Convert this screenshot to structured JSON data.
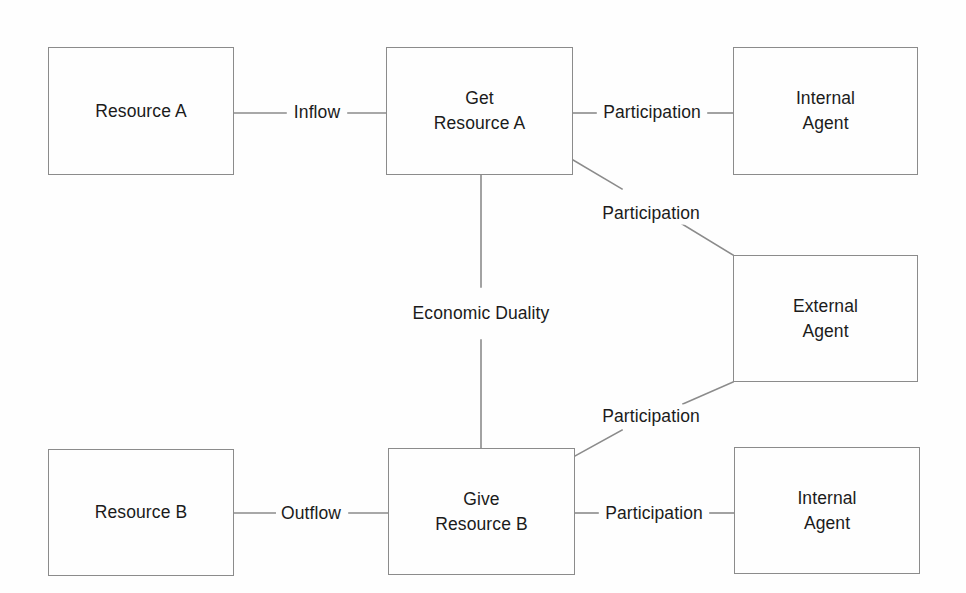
{
  "diagram": {
    "background_color": "#fefefe",
    "line_color": "#8b8b8b",
    "text_color": "#1b1b1b",
    "nodes": [
      {
        "id": "resource-a",
        "label": "Resource A",
        "x": 48,
        "y": 47,
        "w": 186,
        "h": 128
      },
      {
        "id": "get-resource-a",
        "label": "Get\nResource A",
        "x": 386,
        "y": 47,
        "w": 187,
        "h": 128
      },
      {
        "id": "internal-agent-top",
        "label": "Internal\nAgent",
        "x": 733,
        "y": 47,
        "w": 185,
        "h": 128
      },
      {
        "id": "external-agent",
        "label": "External\nAgent",
        "x": 733,
        "y": 255,
        "w": 185,
        "h": 127
      },
      {
        "id": "resource-b",
        "label": "Resource B",
        "x": 48,
        "y": 449,
        "w": 186,
        "h": 127
      },
      {
        "id": "give-resource-b",
        "label": "Give\nResource B",
        "x": 388,
        "y": 448,
        "w": 187,
        "h": 127
      },
      {
        "id": "internal-agent-bottom",
        "label": "Internal\nAgent",
        "x": 734,
        "y": 447,
        "w": 186,
        "h": 127
      }
    ],
    "edges": [
      {
        "id": "inflow",
        "label": "Inflow",
        "from": "resource-a",
        "to": "get-resource-a",
        "label_x": 317,
        "label_y": 112
      },
      {
        "id": "participation-top",
        "label": "Participation",
        "from": "get-resource-a",
        "to": "internal-agent-top",
        "label_x": 652,
        "label_y": 112
      },
      {
        "id": "participation-upper-diagonal",
        "label": "Participation",
        "from": "get-resource-a",
        "to": "external-agent",
        "label_x": 651,
        "label_y": 213
      },
      {
        "id": "economic-duality",
        "label": "Economic\nDuality",
        "from": "get-resource-a",
        "to": "give-resource-b",
        "label_x": 481,
        "label_y": 313
      },
      {
        "id": "participation-lower-diagonal",
        "label": "Participation",
        "from": "external-agent",
        "to": "give-resource-b",
        "label_x": 651,
        "label_y": 416
      },
      {
        "id": "outflow",
        "label": "Outflow",
        "from": "resource-b",
        "to": "give-resource-b",
        "label_x": 311,
        "label_y": 513
      },
      {
        "id": "participation-bottom",
        "label": "Participation",
        "from": "give-resource-b",
        "to": "internal-agent-bottom",
        "label_x": 654,
        "label_y": 513
      }
    ],
    "segments": [
      {
        "id": "seg-inflow-left",
        "x1": 234,
        "y1": 113,
        "x2": 286,
        "y2": 113
      },
      {
        "id": "seg-inflow-right",
        "x1": 348,
        "y1": 113,
        "x2": 386,
        "y2": 113
      },
      {
        "id": "seg-part-top-left",
        "x1": 573,
        "y1": 113,
        "x2": 596,
        "y2": 113
      },
      {
        "id": "seg-part-top-right",
        "x1": 708,
        "y1": 113,
        "x2": 733,
        "y2": 113
      },
      {
        "id": "seg-diag-upper-a",
        "x1": 573,
        "y1": 160,
        "x2": 622,
        "y2": 189
      },
      {
        "id": "seg-diag-upper-b",
        "x1": 682,
        "y1": 224,
        "x2": 733,
        "y2": 255
      },
      {
        "id": "seg-duality-top",
        "x1": 481,
        "y1": 175,
        "x2": 481,
        "y2": 287
      },
      {
        "id": "seg-duality-bottom",
        "x1": 481,
        "y1": 340,
        "x2": 481,
        "y2": 448
      },
      {
        "id": "seg-diag-lower-a",
        "x1": 733,
        "y1": 382,
        "x2": 683,
        "y2": 404
      },
      {
        "id": "seg-diag-lower-b",
        "x1": 622,
        "y1": 430,
        "x2": 575,
        "y2": 456
      },
      {
        "id": "seg-outflow-left",
        "x1": 234,
        "y1": 513,
        "x2": 276,
        "y2": 513
      },
      {
        "id": "seg-outflow-right",
        "x1": 349,
        "y1": 513,
        "x2": 388,
        "y2": 513
      },
      {
        "id": "seg-part-bot-left",
        "x1": 575,
        "y1": 513,
        "x2": 598,
        "y2": 513
      },
      {
        "id": "seg-part-bot-right",
        "x1": 710,
        "y1": 513,
        "x2": 734,
        "y2": 513
      }
    ]
  }
}
